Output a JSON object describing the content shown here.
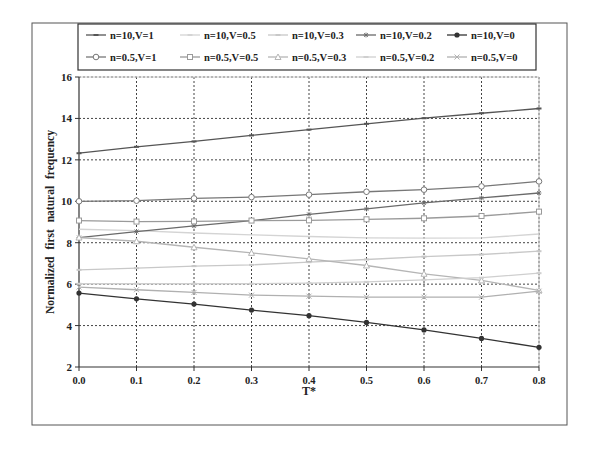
{
  "chart_data": {
    "type": "line",
    "title": "",
    "xlabel": "T*",
    "ylabel": "Normalized first natural frequency",
    "x": [
      0.0,
      0.1,
      0.2,
      0.3,
      0.4,
      0.5,
      0.6,
      0.7,
      0.8
    ],
    "x_tick_labels": [
      "0.0",
      "0.1",
      "0.2",
      "0.3",
      "0.4",
      "0.5",
      "0.6",
      "0.7",
      "0.8"
    ],
    "y_ticks": [
      2,
      4,
      6,
      8,
      10,
      12,
      14,
      16
    ],
    "xlim": [
      0.0,
      0.8
    ],
    "ylim": [
      2,
      16
    ],
    "grid": true,
    "legend_position": "top",
    "series": [
      {
        "name": "n=10,V=1",
        "marker": "dash",
        "color": "#555555",
        "values": [
          12.32,
          12.63,
          12.89,
          13.18,
          13.46,
          13.74,
          14.01,
          14.25,
          14.48
        ]
      },
      {
        "name": "n=10,V=0.5",
        "marker": "none",
        "color": "#d4d4d4",
        "values": [
          8.65,
          8.58,
          8.47,
          8.38,
          8.3,
          8.23,
          8.22,
          8.23,
          8.42
        ]
      },
      {
        "name": "n=10,V=0.3",
        "marker": "dash",
        "color": "#c8c8c8",
        "values": [
          6.69,
          6.77,
          6.87,
          6.93,
          7.06,
          7.19,
          7.33,
          7.43,
          7.59
        ]
      },
      {
        "name": "n=10,V=0.2",
        "marker": "star",
        "color": "#6a6a6a",
        "values": [
          8.25,
          8.54,
          8.81,
          9.07,
          9.37,
          9.63,
          9.92,
          10.16,
          10.4
        ]
      },
      {
        "name": "n=10,V=0",
        "marker": "dot",
        "color": "#333333",
        "values": [
          5.57,
          5.29,
          5.04,
          4.75,
          4.48,
          4.15,
          3.79,
          3.38,
          2.95
        ]
      },
      {
        "name": "n=0.5,V=1",
        "marker": "diamond",
        "color": "#777777",
        "values": [
          10.0,
          10.03,
          10.14,
          10.2,
          10.32,
          10.46,
          10.56,
          10.72,
          10.96
        ]
      },
      {
        "name": "n=0.5,V=0.5",
        "marker": "square",
        "color": "#9a9a9a",
        "values": [
          9.07,
          9.02,
          9.03,
          9.07,
          9.08,
          9.13,
          9.18,
          9.29,
          9.5
        ]
      },
      {
        "name": "n=0.5,V=0.3",
        "marker": "triangle",
        "color": "#b5b5b5",
        "values": [
          8.25,
          8.07,
          7.78,
          7.51,
          7.22,
          6.9,
          6.5,
          6.18,
          5.7
        ]
      },
      {
        "name": "n=0.5,V=0.2",
        "marker": "dash",
        "color": "#cfcfcf",
        "values": [
          6.02,
          6.02,
          6.02,
          6.02,
          6.05,
          6.11,
          6.21,
          6.31,
          6.53
        ]
      },
      {
        "name": "n=0.5,V=0",
        "marker": "x",
        "color": "#b0b0b0",
        "values": [
          5.86,
          5.73,
          5.6,
          5.47,
          5.42,
          5.37,
          5.37,
          5.37,
          5.66
        ]
      }
    ]
  },
  "legend": {
    "items": [
      {
        "label": "n=10,V=1"
      },
      {
        "label": "n=10,V=0.5"
      },
      {
        "label": "n=10,V=0.3"
      },
      {
        "label": "n=10,V=0.2"
      },
      {
        "label": "n=10,V=0"
      },
      {
        "label": "n=0.5,V=1"
      },
      {
        "label": "n=0.5,V=0.5"
      },
      {
        "label": "n=0.5,V=0.3"
      },
      {
        "label": "n=0.5,V=0.2"
      },
      {
        "label": "n=0.5,V=0"
      }
    ]
  }
}
